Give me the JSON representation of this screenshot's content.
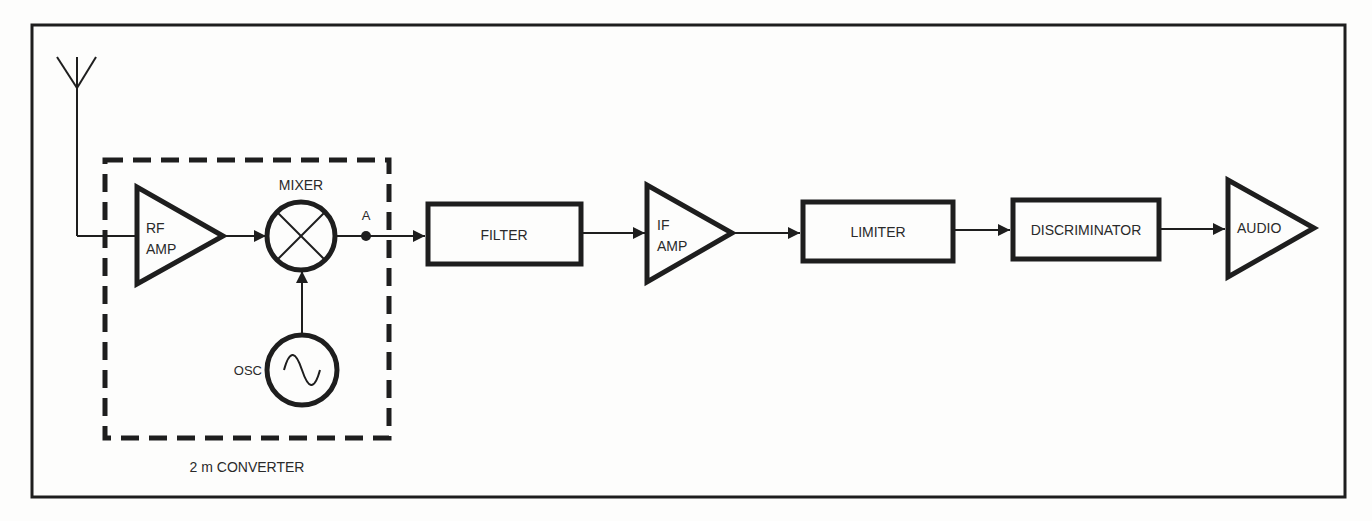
{
  "diagram": {
    "type": "block-diagram",
    "colors": {
      "ink": "#1e1e1e",
      "paper": "#fdfdfc"
    },
    "blocks": {
      "antenna": {
        "label": ""
      },
      "rf_amp": {
        "line1": "RF",
        "line2": "AMP"
      },
      "mixer": {
        "label": "MIXER"
      },
      "point_a": {
        "label": "A"
      },
      "osc": {
        "label": "OSC"
      },
      "filter": {
        "label": "FILTER"
      },
      "if_amp": {
        "line1": "IF",
        "line2": "AMP"
      },
      "limiter": {
        "label": "LIMITER"
      },
      "discriminator": {
        "label": "DISCRIMINATOR"
      },
      "audio": {
        "label": "AUDIO"
      }
    },
    "converter_group": {
      "label": "2 m CONVERTER"
    },
    "signal_flow": [
      "Antenna",
      "RF AMP",
      "MIXER",
      "A",
      "FILTER",
      "IF AMP",
      "LIMITER",
      "DISCRIMINATOR",
      "AUDIO"
    ],
    "osc_feeds": "MIXER"
  }
}
